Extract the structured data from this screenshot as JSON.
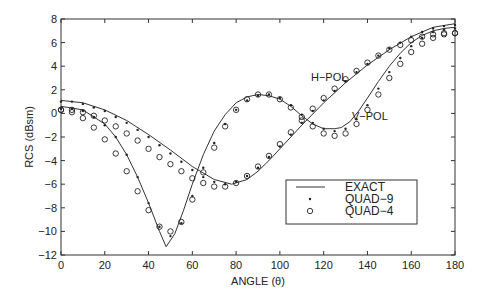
{
  "chart_data": {
    "type": "line",
    "title": "",
    "xlabel": "ANGLE (θ)",
    "ylabel": "RCS (dBsm)",
    "xlim": [
      0,
      180
    ],
    "ylim": [
      -12,
      8
    ],
    "xticks": [
      0,
      20,
      40,
      60,
      80,
      100,
      120,
      140,
      160,
      180
    ],
    "yticks": [
      -12,
      -10,
      -8,
      -6,
      -4,
      -2,
      0,
      2,
      4,
      6,
      8
    ],
    "grid": false,
    "legend_position": "lower-right",
    "legend": [
      {
        "label": "EXACT",
        "style": "solid-line"
      },
      {
        "label": "QUAD−9",
        "style": "dot-marker"
      },
      {
        "label": "QUAD−4",
        "style": "circle-marker"
      }
    ],
    "annotations": [
      {
        "text": "H−POL",
        "x": 128,
        "y": 5.1
      },
      {
        "text": "V−POL",
        "x": 148,
        "y": -1.1
      }
    ],
    "series": [
      {
        "name": "H-POL EXACT",
        "style": "solid-line",
        "x": [
          0,
          10,
          20,
          30,
          40,
          50,
          60,
          70,
          78,
          85,
          90,
          95,
          100,
          110,
          120,
          130,
          140,
          150,
          160,
          170,
          180
        ],
        "y": [
          1.1,
          0.9,
          0.3,
          -0.6,
          -1.8,
          -3.1,
          -4.5,
          -5.6,
          -6.0,
          -5.6,
          -4.9,
          -4.0,
          -3.0,
          -1.0,
          0.9,
          2.6,
          4.1,
          5.4,
          6.5,
          7.3,
          7.6
        ]
      },
      {
        "name": "V-POL EXACT",
        "style": "solid-line",
        "x": [
          0,
          10,
          20,
          25,
          30,
          35,
          40,
          45,
          48,
          52,
          56,
          60,
          65,
          70,
          75,
          80,
          85,
          90,
          95,
          100,
          105,
          110,
          115,
          120,
          125,
          128,
          132,
          136,
          140,
          145,
          150,
          155,
          160,
          165,
          170,
          175,
          180
        ],
        "y": [
          0.6,
          0.3,
          -0.9,
          -2.0,
          -3.5,
          -5.4,
          -7.6,
          -10.0,
          -11.3,
          -10.2,
          -8.2,
          -6.0,
          -3.5,
          -1.5,
          -0.1,
          0.9,
          1.4,
          1.6,
          1.5,
          1.2,
          0.6,
          -0.2,
          -0.9,
          -1.3,
          -1.3,
          -1.2,
          -0.7,
          0.2,
          1.3,
          2.7,
          4.0,
          5.1,
          6.0,
          6.6,
          7.0,
          7.2,
          7.3
        ]
      },
      {
        "name": "H-POL QUAD-9",
        "style": "dot-marker",
        "x": [
          0,
          5,
          10,
          15,
          20,
          25,
          30,
          35,
          40,
          45,
          50,
          55,
          60,
          65,
          70,
          75,
          80,
          85,
          90,
          95,
          100,
          105,
          110,
          115,
          120,
          125,
          130,
          135,
          140,
          145,
          150,
          155,
          160,
          165,
          170,
          175,
          180
        ],
        "y": [
          1.0,
          1.0,
          0.8,
          0.5,
          0.2,
          -0.3,
          -0.8,
          -1.4,
          -2.0,
          -2.7,
          -3.4,
          -4.1,
          -4.8,
          -5.4,
          -5.8,
          -6.0,
          -5.8,
          -5.3,
          -4.6,
          -3.7,
          -2.8,
          -1.8,
          -0.8,
          0.2,
          1.1,
          1.9,
          2.7,
          3.5,
          4.2,
          4.9,
          5.5,
          6.0,
          6.5,
          6.9,
          7.2,
          7.4,
          7.5
        ]
      },
      {
        "name": "V-POL QUAD-9",
        "style": "dot-marker",
        "x": [
          0,
          5,
          10,
          15,
          20,
          25,
          30,
          35,
          40,
          45,
          50,
          55,
          60,
          65,
          70,
          75,
          80,
          85,
          90,
          95,
          100,
          105,
          110,
          115,
          120,
          125,
          130,
          135,
          140,
          145,
          150,
          155,
          160,
          165,
          170,
          175,
          180
        ],
        "y": [
          0.4,
          0.4,
          0.2,
          -0.3,
          -1.0,
          -2.0,
          -3.5,
          -5.4,
          -7.6,
          -9.6,
          -10.4,
          -9.3,
          -7.0,
          -4.6,
          -2.5,
          -0.9,
          0.3,
          1.1,
          1.5,
          1.6,
          1.3,
          0.7,
          -0.1,
          -0.8,
          -1.3,
          -1.5,
          -1.3,
          -0.5,
          0.7,
          2.1,
          3.5,
          4.7,
          5.7,
          6.4,
          6.9,
          7.1,
          7.2
        ]
      },
      {
        "name": "H-POL QUAD-4",
        "style": "circle-marker",
        "x": [
          0,
          5,
          10,
          15,
          20,
          25,
          30,
          35,
          40,
          45,
          50,
          55,
          60,
          65,
          70,
          75,
          80,
          85,
          90,
          95,
          100,
          105,
          110,
          115,
          120,
          125,
          130,
          135,
          140,
          145,
          150,
          155,
          160,
          165,
          170,
          175,
          180
        ],
        "y": [
          0.3,
          0.3,
          0.1,
          -0.2,
          -0.6,
          -1.1,
          -1.7,
          -2.3,
          -3.0,
          -3.7,
          -4.3,
          -4.9,
          -5.5,
          -5.9,
          -6.2,
          -6.2,
          -5.9,
          -5.3,
          -4.5,
          -3.6,
          -2.6,
          -1.6,
          -0.6,
          0.4,
          1.3,
          2.1,
          2.9,
          3.6,
          4.3,
          4.9,
          5.4,
          5.8,
          6.2,
          6.5,
          6.7,
          6.8,
          6.8
        ]
      },
      {
        "name": "V-POL QUAD-4",
        "style": "circle-marker",
        "x": [
          0,
          5,
          10,
          15,
          20,
          25,
          30,
          35,
          40,
          45,
          50,
          55,
          60,
          65,
          70,
          75,
          80,
          85,
          90,
          95,
          100,
          105,
          110,
          115,
          120,
          125,
          130,
          135,
          140,
          145,
          150,
          155,
          160,
          165,
          170,
          175,
          180
        ],
        "y": [
          0.3,
          0.1,
          -0.4,
          -1.2,
          -2.2,
          -3.4,
          -4.9,
          -6.6,
          -8.2,
          -9.6,
          -10.0,
          -9.2,
          -7.3,
          -5.0,
          -2.9,
          -1.1,
          0.3,
          1.2,
          1.6,
          1.6,
          1.2,
          0.5,
          -0.3,
          -1.1,
          -1.7,
          -1.9,
          -1.7,
          -0.9,
          0.3,
          1.6,
          3.0,
          4.2,
          5.2,
          5.9,
          6.4,
          6.7,
          6.8
        ]
      }
    ]
  }
}
